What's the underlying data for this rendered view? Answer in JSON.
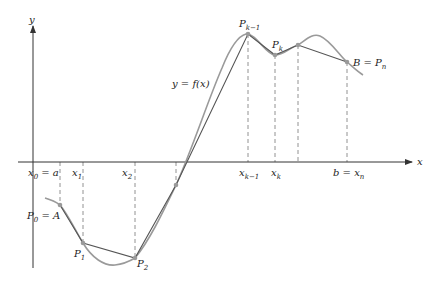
{
  "diagram": {
    "colors": {
      "axis": "#333333",
      "curve": "#9a9a9a",
      "polygon": "#555555",
      "dashed": "#777777",
      "point": "#9a9a9a",
      "text": "#222222"
    },
    "axes": {
      "x_label": "x",
      "y_label": "y"
    },
    "curve_label": "y = f(x)",
    "x_ticks": [
      {
        "main": "x",
        "sub": "0",
        "suffix": " = a"
      },
      {
        "main": "x",
        "sub": "1",
        "suffix": ""
      },
      {
        "main": "x",
        "sub": "2",
        "suffix": ""
      },
      {
        "main": "x",
        "sub": "k−1",
        "suffix": ""
      },
      {
        "main": "x",
        "sub": "k",
        "suffix": ""
      },
      {
        "main": "b = x",
        "sub": "n",
        "suffix": ""
      }
    ],
    "point_labels": [
      {
        "main": "P",
        "sub": "0",
        "suffix": " = A"
      },
      {
        "main": "P",
        "sub": "1",
        "suffix": ""
      },
      {
        "main": "P",
        "sub": "2",
        "suffix": ""
      },
      {
        "main": "P",
        "sub": "k−1",
        "suffix": ""
      },
      {
        "main": "P",
        "sub": "k",
        "suffix": ""
      },
      {
        "main": "B = P",
        "sub": "n",
        "suffix": ""
      }
    ]
  }
}
